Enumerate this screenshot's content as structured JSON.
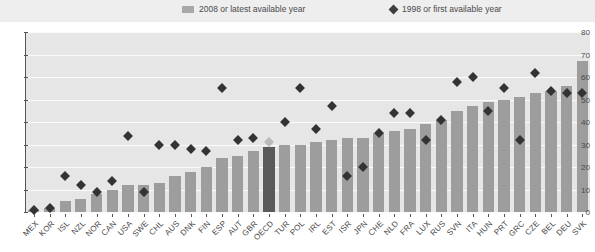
{
  "legend": {
    "series_bar_label": "2008 or latest available year",
    "series_marker_label": "1998 or first available year",
    "bar_color": "#a8a8a8",
    "marker_color": "#3f3f3f"
  },
  "chart_data": {
    "type": "bar",
    "title": "",
    "xlabel": "",
    "ylabel": "",
    "ylim": [
      0,
      80
    ],
    "yticks": [
      0,
      10,
      20,
      30,
      40,
      50,
      60,
      70,
      80
    ],
    "grid": true,
    "legend_position": "top",
    "highlight_category": "OECD",
    "categories": [
      "MEX",
      "KOR",
      "ISL",
      "NZL",
      "NOR",
      "CAN",
      "USA",
      "SWE",
      "CHL",
      "AUS",
      "DNK",
      "FIN",
      "ESP",
      "AUT",
      "GBR",
      "OECD",
      "TUR",
      "POL",
      "IRL",
      "EST",
      "ISR",
      "JPN",
      "CHE",
      "NLD",
      "FRA",
      "LUX",
      "RUS",
      "SVN",
      "ITA",
      "HUN",
      "PRT",
      "GRC",
      "CZE",
      "BEL",
      "DEU",
      "SVK"
    ],
    "series": [
      {
        "name": "2008 or latest available year",
        "type": "bar",
        "values": [
          1,
          2,
          5,
          6,
          8,
          10,
          12,
          12,
          13,
          16,
          18,
          20,
          24,
          25,
          27,
          29,
          30,
          30,
          31,
          32,
          33,
          33,
          35,
          36,
          37,
          39,
          41,
          45,
          47,
          49,
          50,
          51,
          53,
          54,
          56,
          67
        ]
      },
      {
        "name": "1998 or first available year",
        "type": "scatter",
        "values": [
          1,
          2,
          16,
          12,
          9,
          14,
          34,
          9,
          30,
          30,
          28,
          27,
          55,
          32,
          33,
          31,
          40,
          55,
          37,
          47,
          16,
          20,
          35,
          44,
          44,
          32,
          41,
          58,
          60,
          45,
          55,
          32,
          62,
          54,
          53,
          53
        ]
      }
    ]
  }
}
